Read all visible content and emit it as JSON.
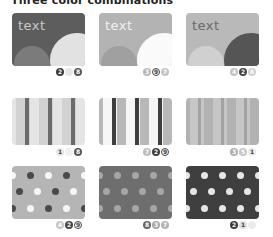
{
  "title": "Three color combinations",
  "cards": [
    {
      "label": "text",
      "bg": "#5d5d5d",
      "text": "#c8c8c8",
      "big": "#e2e2e2",
      "small": "#7b7b7b",
      "badges": [
        {
          "n": "2",
          "bg": "#3a3a3a",
          "fg": "#fff"
        },
        {
          "n": "",
          "bg": "#e6e6e6",
          "fg": "#fff"
        },
        {
          "n": "8",
          "bg": "#555",
          "fg": "#fff"
        }
      ]
    },
    {
      "label": "text",
      "bg": "#b3b3b3",
      "text": "#f0f0f0",
      "big": "#fafafa",
      "small": "#a0a0a0",
      "badges": [
        {
          "n": "3",
          "bg": "#b8b8b8",
          "fg": "#fff"
        },
        {
          "n": "9",
          "bg": "#fff",
          "fg": "#444",
          "ring": true
        },
        {
          "n": "7",
          "bg": "#c4c4c4",
          "fg": "#fff"
        }
      ]
    },
    {
      "label": "text",
      "bg": "#b9b9b9",
      "text": "#6a6a6a",
      "big": "#555555",
      "small": "#d0d0d0",
      "badges": [
        {
          "n": "4",
          "bg": "#c2c2c2",
          "fg": "#fff"
        },
        {
          "n": "2",
          "bg": "#444",
          "fg": "#fff"
        },
        {
          "n": "6",
          "bg": "#cfcfcf",
          "fg": "#fff"
        }
      ]
    },
    {
      "bg": "#e4e4e4",
      "light": "#d2d2d2",
      "dark": "#6b6b6b",
      "badges": [
        {
          "n": "1",
          "bg": "#e6e6e6",
          "fg": "#444"
        },
        {
          "n": "",
          "bg": "#f0f0f0",
          "fg": "#fff"
        },
        {
          "n": "8",
          "bg": "#555",
          "fg": "#fff"
        }
      ]
    },
    {
      "bg": "#b8b8b8",
      "light": "#f6f6f6",
      "dark": "#3e3e3e",
      "badges": [
        {
          "n": "7",
          "bg": "#bdbdbd",
          "fg": "#fff"
        },
        {
          "n": "2",
          "bg": "#3e3e3e",
          "fg": "#fff"
        },
        {
          "n": "9",
          "bg": "#fff",
          "fg": "#444",
          "ring": true
        }
      ]
    },
    {
      "bg": "#b2b2b2",
      "light": "#c6c6c6",
      "dark": "#a2a2a2",
      "badges": [
        {
          "n": "3",
          "bg": "#b0b0b0",
          "fg": "#fff"
        },
        {
          "n": "5",
          "bg": "#c6c6c6",
          "fg": "#fff"
        },
        {
          "n": "1",
          "bg": "#e9e9e9",
          "fg": "#444"
        }
      ]
    },
    {
      "bg": "#b5b5b5",
      "d1": "#4a4a4a",
      "d2": "#f6f6f6",
      "badges": [
        {
          "n": "4",
          "bg": "#c6c6c6",
          "fg": "#fff"
        },
        {
          "n": "2",
          "bg": "#444",
          "fg": "#fff"
        },
        {
          "n": "9",
          "bg": "#fff",
          "fg": "#444",
          "ring": true
        }
      ]
    },
    {
      "bg": "#6e6e6e",
      "d1": "#a6a6a6",
      "d2": "#a6a6a6",
      "badges": [
        {
          "n": "8",
          "bg": "#666",
          "fg": "#fff"
        },
        {
          "n": "3",
          "bg": "#a8a8a8",
          "fg": "#fff"
        },
        {
          "n": "7",
          "bg": "#b4b4b4",
          "fg": "#fff"
        }
      ]
    },
    {
      "bg": "#3f3f3f",
      "d1": "#e6e6e6",
      "d2": "#e6e6e6",
      "badges": [
        {
          "n": "2",
          "bg": "#3a3a3a",
          "fg": "#fff"
        },
        {
          "n": "1",
          "bg": "#dedede",
          "fg": "#444"
        },
        {
          "n": "",
          "bg": "#ececec",
          "fg": "#fff"
        }
      ]
    }
  ]
}
